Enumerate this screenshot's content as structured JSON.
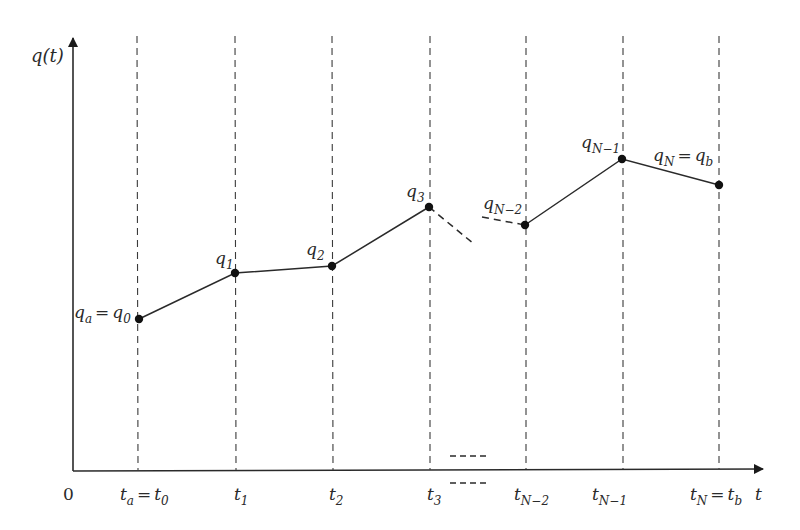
{
  "diagram": {
    "y_axis": {
      "label_main": "q",
      "label_paren": "(t)"
    },
    "x_axis": {
      "label": "t",
      "origin": "0"
    },
    "time_labels": [
      {
        "main": "t",
        "sub": "a",
        "eq": "=",
        "main2": "t",
        "sub2": "0"
      },
      {
        "main": "t",
        "sub": "1"
      },
      {
        "main": "t",
        "sub": "2"
      },
      {
        "main": "t",
        "sub": "3"
      },
      {
        "main": "t",
        "sub": "N−2"
      },
      {
        "main": "t",
        "sub": "N−1"
      },
      {
        "main": "t",
        "sub": "N",
        "eq": "=",
        "main2": "t",
        "sub2": "b"
      }
    ],
    "point_labels": [
      {
        "main": "q",
        "sub": "a",
        "eq": "=",
        "main2": "q",
        "sub2": "0"
      },
      {
        "main": "q",
        "sub": "1"
      },
      {
        "main": "q",
        "sub": "2"
      },
      {
        "main": "q",
        "sub": "3"
      },
      {
        "main": "q",
        "sub": "N−2"
      },
      {
        "main": "q",
        "sub": "N−1"
      },
      {
        "main": "q",
        "sub": "N",
        "eq": "=",
        "main2": "q",
        "sub2": "b"
      }
    ],
    "colors": {
      "line": "#2a2a2a",
      "point": "#111111",
      "background": "#ffffff"
    }
  }
}
